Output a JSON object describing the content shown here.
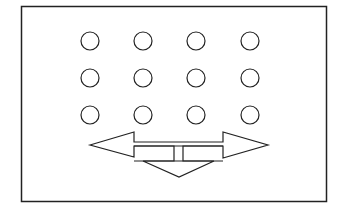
{
  "diagram": {
    "frame": {
      "x": 21,
      "y": 6,
      "width": 306,
      "height": 196,
      "stroke": "#222222"
    },
    "circles": {
      "rows": 3,
      "cols": 4,
      "centers_x": [
        90,
        143,
        196,
        250
      ],
      "centers_y": [
        41,
        78,
        115
      ],
      "radius": 9,
      "stroke": "#222222"
    },
    "arrows": {
      "stroke": "#222222",
      "directions": [
        "left",
        "right",
        "down"
      ]
    }
  }
}
